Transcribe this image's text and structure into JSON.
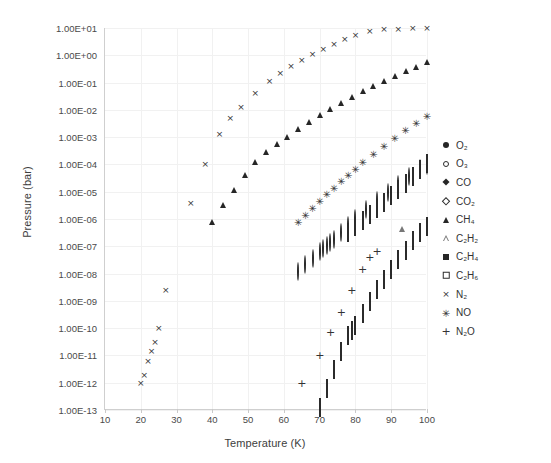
{
  "chart_data": {
    "type": "scatter",
    "title": "",
    "xlabel": "Temperature (K)",
    "ylabel": "Pressure (bar)",
    "xscale": "linear",
    "yscale": "log",
    "xlim": [
      10,
      100
    ],
    "ylim": [
      1e-13,
      10
    ],
    "grid": true,
    "legend_position": "right",
    "xticks": [
      10,
      20,
      30,
      40,
      50,
      60,
      70,
      80,
      90,
      100
    ],
    "xtick_labels": [
      "10",
      "20",
      "30",
      "40",
      "50",
      "60",
      "70",
      "80",
      "90",
      "100"
    ],
    "yticks": [
      10,
      1,
      0.1,
      0.01,
      0.001,
      0.0001,
      1e-05,
      1e-06,
      1e-07,
      1e-08,
      1e-09,
      1e-10,
      1e-11,
      1e-12,
      1e-13
    ],
    "ytick_labels": [
      "1.00E+01",
      "1.00E+00",
      "1.00E-01",
      "1.00E-02",
      "1.00E-03",
      "1.00E-04",
      "1.00E-05",
      "1.00E-06",
      "1.00E-07",
      "1.00E-08",
      "1.00E-09",
      "1.00E-10",
      "1.00E-11",
      "1.00E-12",
      "1.00E-13"
    ],
    "series": [
      {
        "name": "O2",
        "label": "O₂",
        "marker": "filled-circle",
        "color": "#262626",
        "x": [
          37,
          40,
          41,
          42,
          44,
          46,
          48,
          50,
          52,
          54,
          56,
          58,
          60,
          62,
          64,
          66,
          68,
          70,
          72,
          74,
          76,
          78,
          80,
          82,
          84,
          86,
          88,
          90,
          92,
          94,
          96,
          98,
          100
        ],
        "y": [
          3e-07,
          6e-06,
          1e-05,
          1.5e-05,
          4e-05,
          0.0001,
          0.00022,
          0.0005,
          0.001,
          0.002,
          0.004,
          0.007,
          0.012,
          0.02,
          0.03,
          0.045,
          0.065,
          0.09,
          0.12,
          0.16,
          0.2,
          0.26,
          0.32,
          0.42,
          0.55,
          0.7,
          0.9,
          1.2,
          1.6,
          2.1,
          2.8,
          3.6,
          4.6
        ]
      },
      {
        "name": "O3",
        "label": "O₃",
        "marker": "open-circle",
        "color": "#2b2b2b",
        "x": [
          64,
          66,
          68,
          70,
          71,
          72,
          73,
          74,
          76,
          78,
          80,
          83,
          86,
          89,
          92,
          95,
          98,
          100
        ],
        "y": [
          1.1e-08,
          2e-08,
          3.4e-08,
          6e-08,
          8e-08,
          1e-07,
          1.3e-07,
          1.7e-07,
          3e-07,
          5.5e-07,
          1e-06,
          2.2e-06,
          4.6e-06,
          9e-06,
          1.8e-05,
          3.4e-05,
          6.6e-05,
          9e-05
        ]
      },
      {
        "name": "CO",
        "label": "CO",
        "marker": "filled-diamond",
        "color": "#262626",
        "x": [
          56,
          58,
          60,
          62,
          64,
          66,
          68,
          70,
          72,
          74,
          76,
          78,
          80,
          83,
          86,
          89,
          92,
          95,
          98,
          100
        ],
        "y": [
          0.0008,
          0.0015,
          0.003,
          0.005,
          0.009,
          0.014,
          0.022,
          0.033,
          0.05,
          0.07,
          0.1,
          0.14,
          0.19,
          0.3,
          0.46,
          0.7,
          1.1,
          1.7,
          2.6,
          3.4
        ]
      },
      {
        "name": "CO2",
        "label": "CO₂",
        "marker": "open-diamond",
        "color": "#2b2b2b",
        "x": [
          70,
          72,
          74,
          76,
          78,
          79,
          80,
          82,
          84,
          86,
          88,
          90,
          92,
          94,
          96,
          98,
          100
        ],
        "y": [
          1.2e-13,
          6e-13,
          3e-12,
          1.3e-11,
          5e-11,
          8e-11,
          1.2e-10,
          3.2e-10,
          9e-10,
          2.4e-09,
          6e-09,
          1.4e-08,
          3.2e-08,
          7e-08,
          1.5e-07,
          3e-07,
          5e-07
        ]
      },
      {
        "name": "CH4",
        "label": "CH₄",
        "marker": "filled-triangle",
        "color": "#262626",
        "x": [
          40,
          43,
          46,
          49,
          52,
          55,
          58,
          61,
          64,
          67,
          70,
          73,
          76,
          79,
          82,
          85,
          88,
          91,
          94,
          97,
          100
        ],
        "y": [
          2e-06,
          8e-06,
          3e-05,
          0.0001,
          0.0003,
          0.0007,
          0.0014,
          0.0026,
          0.005,
          0.009,
          0.016,
          0.028,
          0.046,
          0.075,
          0.12,
          0.19,
          0.3,
          0.44,
          0.65,
          0.95,
          1.4
        ]
      },
      {
        "name": "C2H2",
        "label": "C₂H₂",
        "marker": "open-triangle",
        "color": "#777777",
        "x": [
          93
        ],
        "y": [
          1.1e-06
        ]
      },
      {
        "name": "C2H4",
        "label": "C₂H₄",
        "marker": "filled-square",
        "color": "#262626",
        "x": [
          76,
          78,
          80,
          82,
          84,
          86,
          88,
          90,
          92,
          94,
          96,
          98,
          100
        ],
        "y": [
          5e-07,
          9e-07,
          1.6e-06,
          2.7e-06,
          4.6e-06,
          8e-06,
          1.4e-05,
          2.4e-05,
          4.2e-05,
          7.5e-05,
          0.00013,
          0.00022,
          0.00036
        ]
      },
      {
        "name": "C2H6",
        "label": "C₂H₆",
        "marker": "open-square",
        "color": "#2b2b2b",
        "x": [
          78,
          80,
          82,
          84,
          86,
          88,
          90,
          92,
          94,
          96,
          98,
          100
        ],
        "y": [
          3.2e-07,
          5.2e-07,
          8.5e-07,
          1.4e-06,
          2.4e-06,
          4e-06,
          6.8e-06,
          1.2e-05,
          2e-05,
          3.4e-05,
          6e-05,
          0.0001
        ]
      },
      {
        "name": "N2",
        "label": "N₂",
        "marker": "cross",
        "color": "#333333",
        "x": [
          20,
          21,
          22,
          23,
          24,
          25,
          27,
          34,
          38,
          42,
          45,
          48,
          52,
          56,
          59,
          62,
          65,
          68,
          71,
          74,
          77,
          80,
          84,
          88,
          92,
          96,
          100
        ],
        "y": [
          1e-12,
          2e-12,
          6e-12,
          1.5e-11,
          3e-11,
          1e-10,
          2.5e-09,
          4e-06,
          0.0001,
          0.0013,
          0.005,
          0.013,
          0.04,
          0.11,
          0.22,
          0.4,
          0.7,
          1.1,
          1.7,
          2.6,
          3.8,
          5.5,
          7.5,
          9.0,
          9.5,
          9.8,
          9.9
        ]
      },
      {
        "name": "NO",
        "label": "NO",
        "marker": "asterisk",
        "color": "#333333",
        "x": [
          64,
          66,
          68,
          70,
          72,
          74,
          76,
          78,
          80,
          82,
          85,
          88,
          91,
          94,
          97,
          100
        ],
        "y": [
          8e-07,
          1.4e-06,
          2.5e-06,
          4.5e-06,
          8e-06,
          1.4e-05,
          2.4e-05,
          4e-05,
          7e-05,
          0.00012,
          0.00024,
          0.00046,
          0.0009,
          0.0018,
          0.0034,
          0.006
        ]
      },
      {
        "name": "N2O",
        "label": "N₂O",
        "marker": "plus",
        "color": "#333333",
        "x": [
          65,
          70,
          73,
          76,
          79,
          82,
          84,
          86
        ],
        "y": [
          1e-12,
          1e-11,
          7e-11,
          4e-10,
          2.5e-09,
          1.5e-08,
          4e-08,
          7e-08
        ]
      }
    ]
  },
  "legend": {
    "entries": [
      {
        "label": "O₂",
        "marker": "filled-circle"
      },
      {
        "label": "O₃",
        "marker": "open-circle"
      },
      {
        "label": "CO",
        "marker": "filled-diamond"
      },
      {
        "label": "CO₂",
        "marker": "open-diamond"
      },
      {
        "label": "CH₄",
        "marker": "filled-triangle"
      },
      {
        "label": "C₂H₂",
        "marker": "open-triangle"
      },
      {
        "label": "C₂H₄",
        "marker": "filled-square"
      },
      {
        "label": "C₂H₆",
        "marker": "open-square"
      },
      {
        "label": "N₂",
        "marker": "cross"
      },
      {
        "label": "NO",
        "marker": "asterisk"
      },
      {
        "label": "N₂O",
        "marker": "plus"
      }
    ]
  },
  "colors": {
    "marker": "#262626",
    "grid": "#f1f1f1",
    "axis": "#cfcfcf",
    "text": "#3d3d3d",
    "background": "#ffffff"
  }
}
